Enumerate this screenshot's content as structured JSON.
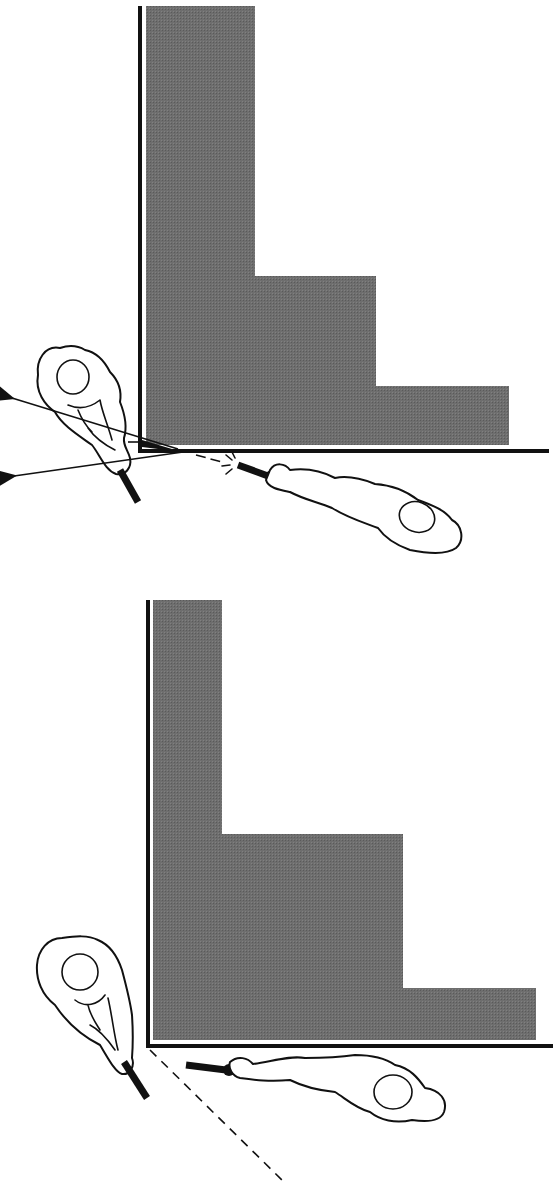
{
  "diagram": {
    "colors": {
      "building_fill": "#6e6e6e",
      "line": "#111111",
      "background": "#ffffff"
    },
    "panels": [
      {
        "id": "top",
        "building_steps": [
          {
            "x": 146,
            "top": 6,
            "right": 255
          },
          {
            "x": 255,
            "top": 276,
            "right": 376
          },
          {
            "x": 376,
            "top": 386,
            "right": 509
          }
        ],
        "building_bottom": 445,
        "wall_x": 140,
        "floor_y": 450,
        "elements": [
          "officer-left-with-two-sight-arrows",
          "officer-right-prone-firing"
        ]
      },
      {
        "id": "bottom",
        "building_steps": [
          {
            "x": 153,
            "top": 600,
            "right": 222
          },
          {
            "x": 222,
            "top": 834,
            "right": 403
          },
          {
            "x": 403,
            "top": 988,
            "right": 536
          }
        ],
        "building_bottom": 1040,
        "wall_x": 148,
        "floor_y": 1047,
        "elements": [
          "officer-left-standing",
          "officer-right-prone",
          "dashed-line-of-sight"
        ]
      }
    ]
  }
}
